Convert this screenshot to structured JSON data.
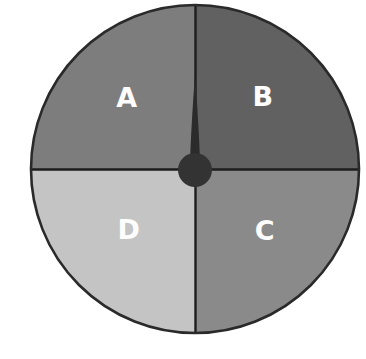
{
  "figure": {
    "name": "spinner-wheel",
    "background_color": "#ffffff"
  },
  "wheel": {
    "center_x": 195,
    "center_y": 169,
    "radius": 164,
    "rim_color": "#2a2a2a",
    "divider_color": "#1d1d1d",
    "label_color": "#fdfdfd"
  },
  "pointer": {
    "name": "spinner-needle",
    "color": "#2b2b2b",
    "hub_color": "#333333",
    "hub_radius": 17,
    "angle_degrees": 0,
    "direction": "up",
    "length": 95,
    "points_to": "boundary between A and B"
  },
  "chart_data": {
    "type": "pie",
    "title": "",
    "subtitle": "",
    "xlabel": "",
    "ylabel": "",
    "legend_position": "none",
    "grid": false,
    "categories": [
      "A",
      "B",
      "C",
      "D"
    ],
    "values": [
      25,
      25,
      25,
      25
    ],
    "units": "percent",
    "slices": [
      {
        "label": "A",
        "value": 25,
        "color": "#7d7d7d",
        "start_angle_degrees": 270,
        "end_angle_degrees": 360,
        "quadrant": "top-left",
        "label_x": 127,
        "label_y": 99
      },
      {
        "label": "B",
        "value": 25,
        "color": "#616161",
        "start_angle_degrees": 0,
        "end_angle_degrees": 90,
        "quadrant": "top-right",
        "label_x": 263,
        "label_y": 98
      },
      {
        "label": "C",
        "value": 25,
        "color": "#8a8a8a",
        "start_angle_degrees": 90,
        "end_angle_degrees": 180,
        "quadrant": "bottom-right",
        "label_x": 265,
        "label_y": 232
      },
      {
        "label": "D",
        "value": 25,
        "color": "#c4c4c4",
        "start_angle_degrees": 180,
        "end_angle_degrees": 270,
        "quadrant": "bottom-left",
        "label_x": 129,
        "label_y": 231
      }
    ]
  }
}
